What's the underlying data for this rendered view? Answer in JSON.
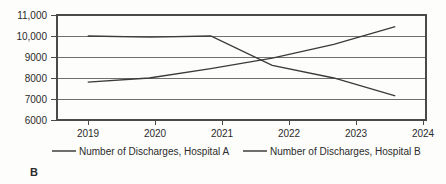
{
  "panel": {
    "label": "B"
  },
  "chart_data": {
    "type": "line",
    "title": "",
    "subtitle": "",
    "xlabel": "",
    "ylabel": "",
    "categories": [
      "2019",
      "2020",
      "2021",
      "2022",
      "2023",
      "2024"
    ],
    "x": [
      2019,
      2020,
      2021,
      2022,
      2023,
      2024
    ],
    "series": [
      {
        "name": "Number of Discharges, Hospital A",
        "values": [
          7800,
          8000,
          8450,
          8950,
          9600,
          10450
        ],
        "color": "#3a3a3a"
      },
      {
        "name": "Number of Discharges, Hospital B",
        "values": [
          10000,
          9950,
          10000,
          8600,
          8000,
          7150
        ],
        "color": "#3a3a3a"
      }
    ],
    "ylim": [
      6000,
      11000
    ],
    "xlim": [
      2018.5,
      2024.5
    ],
    "yticks": [
      6000,
      7000,
      8000,
      9000,
      10000,
      11000
    ],
    "ytick_labels": [
      "6000",
      "7000",
      "8000",
      "9000",
      "10,000",
      "11,000"
    ],
    "xtick_labels": [
      "2019",
      "2020",
      "2021",
      "2022",
      "2023",
      "2024"
    ],
    "grid": true,
    "grid_axis": "y",
    "legend_position": "bottom"
  },
  "legend": {
    "items": [
      {
        "label": "Number of Discharges, Hospital A"
      },
      {
        "label": "Number of Discharges, Hospital B"
      }
    ]
  }
}
